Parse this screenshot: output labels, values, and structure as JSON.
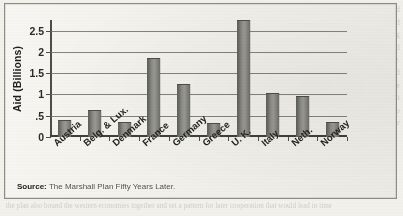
{
  "figure": {
    "source_label": "Source:",
    "source_text": "The Marshall Plan Fifty Years Later."
  },
  "ghost_text": {
    "column": "and his successors about how much to spend. The funds and the material aid arrived across the Atlantic and were distributed through national recovery boards in each of the participating states. The American mission in Paris tracked the spending and reported back to Washington on the progress of recovery. Within four years industrial output in western Europe had climbed well above the prewar level and trade among the member states had more than doubled. Critics argued that recovery would have come without the aid, but the plan also bound the western economies together and set a pattern for later cooperation that would lead in time to the common market.",
    "bottom_line": "the plan also bound the western economies together and set a pattern for later cooperation that would lead in time"
  },
  "colors": {
    "bar_fill": "#8a8a85",
    "bar_edge": "#4d4d48",
    "gridline": "#6f6f6a",
    "axis": "#3f3f3c",
    "panel": "#f2f1ec"
  },
  "chart_data": {
    "type": "bar",
    "title": "",
    "xlabel": "",
    "ylabel": "Aid (Billions)",
    "ylim": [
      0,
      2.75
    ],
    "yticks": [
      0,
      0.5,
      1,
      1.5,
      2,
      2.5
    ],
    "ytick_labels": [
      "0",
      ".5",
      "1",
      "1.5",
      "2",
      "2.5"
    ],
    "grid": true,
    "legend": "none",
    "categories": [
      "Austria",
      "Belg. & Lux.",
      "Denmark",
      "France",
      "Germany",
      "Greece",
      "U. K.",
      "Italy",
      "Neth.",
      "Norway"
    ],
    "values": [
      0.38,
      0.62,
      0.32,
      1.83,
      1.22,
      0.3,
      2.72,
      1.01,
      0.94,
      0.32
    ],
    "series": [
      {
        "name": "Aid",
        "values": [
          0.38,
          0.62,
          0.32,
          1.83,
          1.22,
          0.3,
          2.72,
          1.01,
          0.94,
          0.32
        ]
      }
    ]
  }
}
